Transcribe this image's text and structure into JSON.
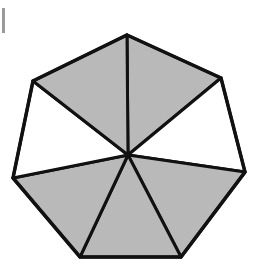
{
  "diagram": {
    "title": "",
    "shape": "heptagon",
    "sides": 7,
    "center": [
      128,
      155
    ],
    "vertices": [
      [
        127,
        35
      ],
      [
        221,
        78
      ],
      [
        245,
        172
      ],
      [
        181,
        257
      ],
      [
        80,
        257
      ],
      [
        13,
        178
      ],
      [
        33,
        81
      ]
    ],
    "colors": {
      "shaded": "#b9b9b9",
      "unshaded": "#ffffff",
      "stroke": "#111111"
    },
    "sectors": [
      {
        "from": 0,
        "to": 1,
        "shaded": true
      },
      {
        "from": 1,
        "to": 2,
        "shaded": false
      },
      {
        "from": 2,
        "to": 3,
        "shaded": true
      },
      {
        "from": 3,
        "to": 4,
        "shaded": true
      },
      {
        "from": 4,
        "to": 5,
        "shaded": true
      },
      {
        "from": 5,
        "to": 6,
        "shaded": false
      },
      {
        "from": 6,
        "to": 0,
        "shaded": true
      }
    ],
    "shaded_count": 5,
    "total_sectors": 7
  }
}
